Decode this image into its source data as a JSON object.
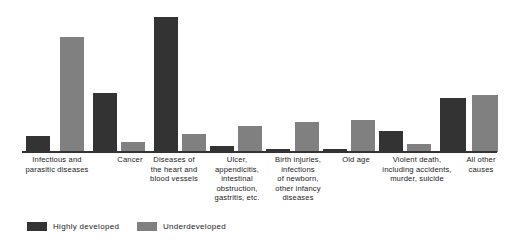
{
  "chart_data": {
    "type": "bar",
    "title": "",
    "subtitle": "",
    "xlabel": "",
    "ylabel": "",
    "grid": false,
    "ylim": [
      0,
      100
    ],
    "legend_position": "bottom-left",
    "categories": [
      "Infectious and parasitic diseases",
      "Cancer",
      "Diseases of the heart and blood vessels",
      "Ulcer, appendicitis, intestinal obstruction, gastritis, etc.",
      "Birth injuries, infections of newborn, other infancy diseases",
      "Old age",
      "Violent death, including accidents, murder, suicide",
      "All other causes"
    ],
    "series": [
      {
        "name": "Highly developed",
        "color": "#333333",
        "values": [
          10,
          41,
          92,
          3,
          4,
          1,
          16,
          49
        ]
      },
      {
        "name": "Underdeveloped",
        "color": "#808080",
        "values": [
          80,
          6,
          0,
          14,
          22,
          23,
          30,
          51
        ]
      }
    ]
  },
  "axis_labels": [
    {
      "lines": [
        "Infectious and",
        "parasitic diseases"
      ],
      "left": 12,
      "width": 90
    },
    {
      "lines": [
        "Cancer"
      ],
      "left": 100,
      "width": 60
    },
    {
      "lines": [
        "Diseases of",
        "the heart and",
        "blood vessels"
      ],
      "left": 140,
      "width": 68
    },
    {
      "lines": [
        "Ulcer,",
        "appendicitis,",
        "intestinal",
        "obstruction,",
        "gastritis, etc."
      ],
      "left": 204,
      "width": 66
    },
    {
      "lines": [
        "Birth injuries,",
        "infections",
        "of newborn,",
        "other infancy",
        "diseases"
      ],
      "left": 263,
      "width": 70
    },
    {
      "lines": [
        "Old age"
      ],
      "left": 330,
      "width": 52
    },
    {
      "lines": [
        "Violent death,",
        "including accidents,",
        "murder, suicide"
      ],
      "left": 374,
      "width": 86
    },
    {
      "lines": [
        "All other",
        "causes"
      ],
      "left": 456,
      "width": 50
    }
  ],
  "legend": {
    "items": [
      {
        "label": "Highly  developed",
        "color": "#333333",
        "left": 27
      },
      {
        "label": "Underdeveloped",
        "color": "#808080",
        "left": 137
      }
    ]
  },
  "bars": [
    {
      "name": "bar-infectious-highly-developed",
      "series": "Highly developed",
      "category": "Infectious and parasitic diseases",
      "value": 10,
      "left": 26,
      "width": 24,
      "height": 16,
      "color": "#333333"
    },
    {
      "name": "bar-infectious-underdeveloped",
      "series": "Underdeveloped",
      "category": "Infectious and parasitic diseases",
      "value": 80,
      "left": 60,
      "width": 24,
      "height": 115,
      "color": "#808080"
    },
    {
      "name": "bar-cancer-highly-developed",
      "series": "Highly developed",
      "category": "Cancer",
      "value": 41,
      "left": 93,
      "width": 24,
      "height": 59,
      "color": "#333333"
    },
    {
      "name": "bar-cancer-underdeveloped",
      "series": "Underdeveloped",
      "category": "Cancer",
      "value": 6,
      "left": 121,
      "width": 24,
      "height": 10,
      "color": "#808080"
    },
    {
      "name": "bar-heart-highly-developed",
      "series": "Highly developed",
      "category": "Diseases of the heart and blood vessels",
      "value": 92,
      "left": 154,
      "width": 24,
      "height": 135,
      "color": "#333333"
    },
    {
      "name": "bar-heart-underdeveloped",
      "series": "Underdeveloped",
      "category": "Diseases of the heart and blood vessels",
      "value": 0,
      "left": 182,
      "width": 24,
      "height": 18,
      "color": "#808080"
    },
    {
      "name": "bar-ulcer-highly-developed",
      "series": "Highly developed",
      "category": "Ulcer, appendicitis, intestinal obstruction, gastritis, etc.",
      "value": 3,
      "left": 210,
      "width": 24,
      "height": 6,
      "color": "#333333"
    },
    {
      "name": "bar-ulcer-underdeveloped",
      "series": "Underdeveloped",
      "category": "Ulcer, appendicitis, intestinal obstruction, gastritis, etc.",
      "value": 14,
      "left": 238,
      "width": 24,
      "height": 26,
      "color": "#808080"
    },
    {
      "name": "bar-birth-highly-developed",
      "series": "Highly developed",
      "category": "Birth injuries, infections of newborn, other infancy diseases",
      "value": 4,
      "left": 266,
      "width": 24,
      "height": 3,
      "color": "#333333"
    },
    {
      "name": "bar-birth-underdeveloped",
      "series": "Underdeveloped",
      "category": "Birth injuries, infections of newborn, other infancy diseases",
      "value": 22,
      "left": 295,
      "width": 24,
      "height": 30,
      "color": "#808080"
    },
    {
      "name": "bar-oldage-highly-developed",
      "series": "Highly developed",
      "category": "Old age",
      "value": 1,
      "left": 323,
      "width": 24,
      "height": 3,
      "color": "#333333"
    },
    {
      "name": "bar-oldage-underdeveloped",
      "series": "Underdeveloped",
      "category": "Old age",
      "value": 23,
      "left": 351,
      "width": 24,
      "height": 32,
      "color": "#808080"
    },
    {
      "name": "bar-violent-highly-developed",
      "series": "Highly developed",
      "category": "Violent death, including accidents, murder, suicide",
      "value": 16,
      "left": 379,
      "width": 24,
      "height": 21,
      "color": "#333333"
    },
    {
      "name": "bar-violent-underdeveloped",
      "series": "Underdeveloped",
      "category": "Violent death, including accidents, murder, suicide",
      "value": 30,
      "left": 407,
      "width": 24,
      "height": 8,
      "color": "#808080"
    },
    {
      "name": "bar-allother-highly-developed",
      "series": "Highly developed",
      "category": "All other causes",
      "value": 49,
      "left": 440,
      "width": 26,
      "height": 54,
      "color": "#333333"
    },
    {
      "name": "bar-allother-underdeveloped",
      "series": "Underdeveloped",
      "category": "All other causes",
      "value": 51,
      "left": 472,
      "width": 26,
      "height": 57,
      "color": "#808080"
    }
  ]
}
